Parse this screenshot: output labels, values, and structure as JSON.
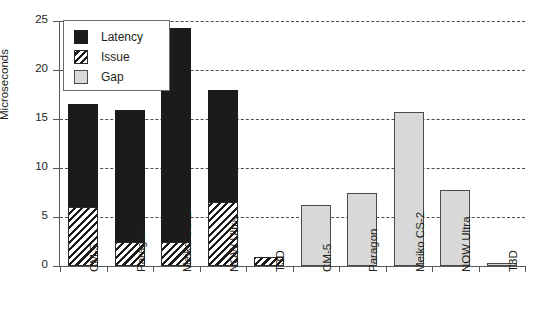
{
  "chart_data": {
    "type": "bar",
    "title": "",
    "xlabel": "",
    "ylabel": "Microseconds",
    "ylim": [
      0,
      25
    ],
    "yticks": [
      0,
      5,
      10,
      15,
      20,
      25
    ],
    "ytick_labels": [
      "0",
      "5",
      "10",
      "15",
      "20",
      "25"
    ],
    "grid": true,
    "grid_axis": "y",
    "grid_style": "dashed",
    "legend_position": "upper-left-inside",
    "stacked": true,
    "categories": [
      "CM-5",
      "Paragon",
      "Meiko CS-2",
      "NOW Ultra",
      "T3D",
      "CM-5",
      "Paragon",
      "Meiko CS-2",
      "NOW Ultra",
      "T3D"
    ],
    "series": [
      {
        "name": "Issue",
        "color": "#1b1b1b",
        "fill": "diagonal-hatch",
        "values": [
          6.0,
          2.5,
          2.5,
          6.5,
          0.9,
          0,
          0,
          0,
          0,
          0
        ]
      },
      {
        "name": "Latency",
        "color": "#1b1b1b",
        "fill": "solid-black",
        "values": [
          10.5,
          13.4,
          21.8,
          11.5,
          0,
          0,
          0,
          0,
          0,
          0
        ]
      },
      {
        "name": "Gap",
        "color": "#d8d8d8",
        "fill": "light-gray",
        "values": [
          0,
          0,
          0,
          0,
          0,
          6.2,
          7.4,
          15.7,
          7.8,
          0.3
        ]
      }
    ],
    "bar_totals": [
      16.5,
      15.9,
      24.3,
      18.0,
      0.9,
      6.2,
      7.4,
      15.7,
      7.8,
      0.3
    ],
    "legend": [
      {
        "label": "Latency",
        "swatch": "solid-black"
      },
      {
        "label": "Issue",
        "swatch": "diagonal-hatch"
      },
      {
        "label": "Gap",
        "swatch": "light-gray"
      }
    ]
  },
  "axes": {
    "y_label": "Microseconds",
    "y_ticks": [
      "25",
      "20",
      "15",
      "10",
      "5",
      "0"
    ]
  },
  "legend": {
    "items": [
      {
        "label": "Latency"
      },
      {
        "label": "Issue"
      },
      {
        "label": "Gap"
      }
    ]
  },
  "x_labels": [
    "CM-5",
    "Paragon",
    "Meiko CS-2",
    "NOW Ultra",
    "T3D",
    "CM-5",
    "Paragon",
    "Meiko CS-2",
    "NOW Ultra",
    "T3D"
  ]
}
